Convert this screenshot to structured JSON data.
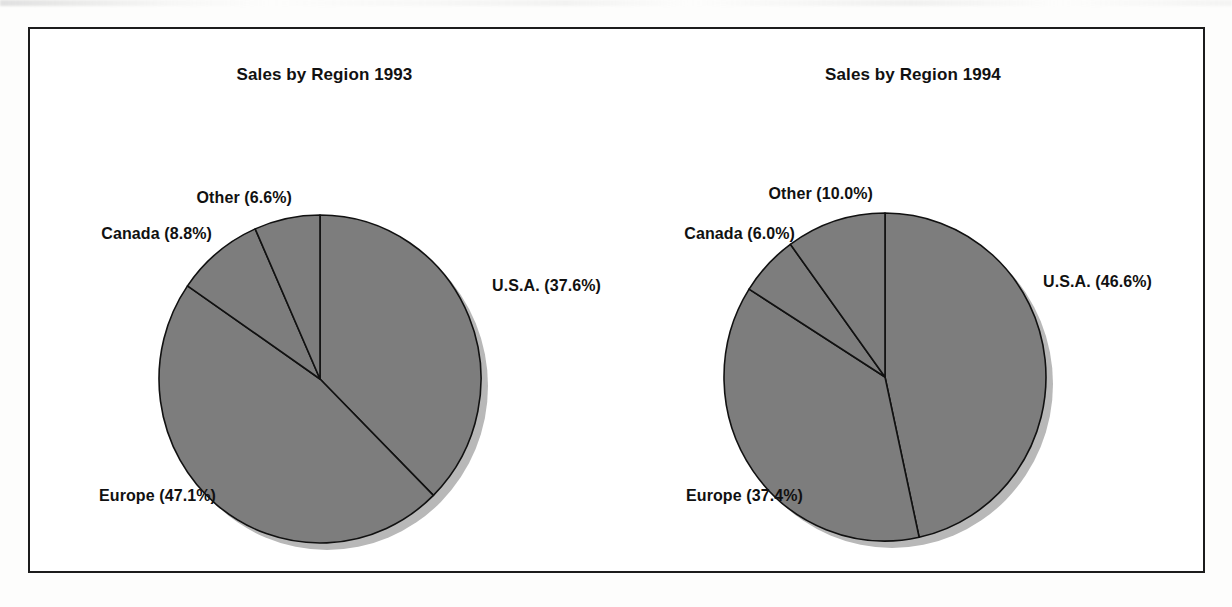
{
  "figure": {
    "border_color": "#1c1c1c",
    "background": "#ffffff",
    "slice_fill": "#7d7d7d",
    "slice_stroke": "#111111",
    "shadow_color": "#b8b8b8"
  },
  "charts": [
    {
      "id": "sales-by-region-1993",
      "title": "Sales by Region 1993",
      "labels": {
        "usa": "U.S.A. (37.6%)",
        "europe": "Europe (47.1%)",
        "canada": "Canada (8.8%)",
        "other": "Other (6.6%)"
      }
    },
    {
      "id": "sales-by-region-1994",
      "title": "Sales by Region 1994",
      "labels": {
        "usa": "U.S.A. (46.6%)",
        "europe": "Europe (37.4%)",
        "canada": "Canada (6.0%)",
        "other": "Other (10.0%)"
      }
    }
  ],
  "chart_data": [
    {
      "type": "pie",
      "title": "Sales by Region 1993",
      "categories": [
        "U.S.A.",
        "Europe",
        "Canada",
        "Other"
      ],
      "values": [
        37.6,
        47.1,
        8.8,
        6.6
      ],
      "value_unit": "%",
      "data_labels": [
        "U.S.A. (37.6%)",
        "Europe (47.1%)",
        "Canada (8.8%)",
        "Other (6.6%)"
      ],
      "start_angle_deg": 0,
      "direction": "clockwise",
      "colors": [
        "#7d7d7d",
        "#7d7d7d",
        "#7d7d7d",
        "#7d7d7d"
      ],
      "legend": "none",
      "labels_position": "outside-callout",
      "grid": false
    },
    {
      "type": "pie",
      "title": "Sales by Region 1994",
      "categories": [
        "U.S.A.",
        "Europe",
        "Canada",
        "Other"
      ],
      "values": [
        46.6,
        37.4,
        6.0,
        10.0
      ],
      "value_unit": "%",
      "data_labels": [
        "U.S.A. (46.6%)",
        "Europe (37.4%)",
        "Canada (6.0%)",
        "Other (10.0%)"
      ],
      "start_angle_deg": 0,
      "direction": "clockwise",
      "colors": [
        "#7d7d7d",
        "#7d7d7d",
        "#7d7d7d",
        "#7d7d7d"
      ],
      "legend": "none",
      "labels_position": "outside-callout",
      "grid": false
    }
  ]
}
